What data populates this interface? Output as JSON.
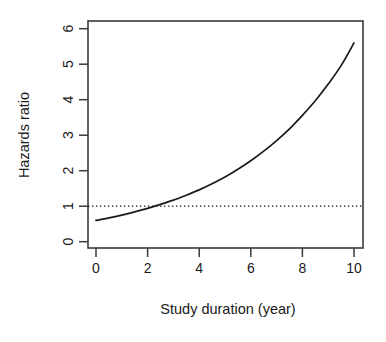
{
  "chart_data": {
    "type": "line",
    "title": "",
    "xlabel": "Study duration (year)",
    "ylabel": "Hazards ratio",
    "xlim": [
      0,
      10
    ],
    "ylim": [
      0,
      6.2
    ],
    "xticks": [
      0,
      2,
      4,
      6,
      8,
      10
    ],
    "yticks": [
      0,
      1,
      2,
      3,
      4,
      5,
      6
    ],
    "xticklabels": [
      "0",
      "2",
      "4",
      "6",
      "8",
      "10"
    ],
    "yticklabels": [
      "0",
      "1",
      "2",
      "3",
      "4",
      "5",
      "6"
    ],
    "grid": false,
    "legend": null,
    "series": [
      {
        "name": "Hazards ratio",
        "style": "solid",
        "color": "#1a1a1a",
        "x": [
          0,
          0.5,
          1,
          1.5,
          2,
          2.5,
          3,
          3.5,
          4,
          4.5,
          5,
          5.5,
          6,
          6.5,
          7,
          7.5,
          8,
          8.5,
          9,
          9.5,
          10
        ],
        "values": [
          0.6,
          0.67,
          0.75,
          0.84,
          0.94,
          1.05,
          1.17,
          1.31,
          1.46,
          1.63,
          1.82,
          2.04,
          2.28,
          2.55,
          2.85,
          3.18,
          3.56,
          3.97,
          4.44,
          4.96,
          5.6
        ]
      }
    ],
    "reference_lines": [
      {
        "name": "null-effect-line",
        "orientation": "horizontal",
        "value": 1,
        "style": "dotted",
        "color": "#1a1a1a"
      }
    ],
    "annotations": [
      {
        "name": "crossing-point",
        "text": "",
        "x": 3.3,
        "y": 1.0
      }
    ]
  },
  "axes": {
    "x_title": "Study duration (year)",
    "y_title": "Hazards ratio"
  }
}
